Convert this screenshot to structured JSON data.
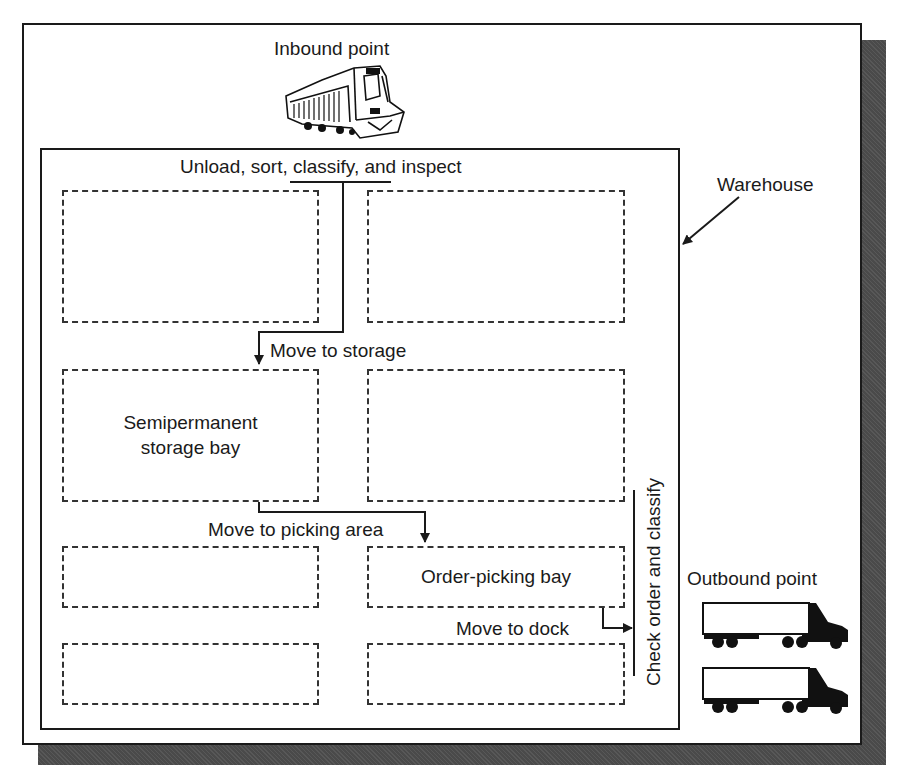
{
  "diagram": {
    "type": "warehouse-flow",
    "labels": {
      "inbound": "Inbound point",
      "outbound": "Outbound point",
      "warehouse": "Warehouse",
      "unload": "Unload, sort, classify, and inspect",
      "move_storage": "Move to storage",
      "move_picking": "Move to picking area",
      "move_dock": "Move to dock",
      "check_order": "Check order and classify"
    },
    "bays": [
      {
        "id": "r1-left",
        "label": ""
      },
      {
        "id": "r1-right",
        "label": ""
      },
      {
        "id": "r2-left",
        "label": "Semipermanent storage bay"
      },
      {
        "id": "r2-right",
        "label": ""
      },
      {
        "id": "r3-left",
        "label": ""
      },
      {
        "id": "r3-right",
        "label": "Order-picking bay"
      },
      {
        "id": "r4-left",
        "label": ""
      },
      {
        "id": "r4-right",
        "label": ""
      }
    ],
    "icons": {
      "inbound": "locomotive-icon",
      "outbound": "semi-truck-icon",
      "outbound_count": 2
    },
    "colors": {
      "line": "#1a1a1a",
      "shadow": "#4a4a4a",
      "background": "#ffffff"
    }
  }
}
